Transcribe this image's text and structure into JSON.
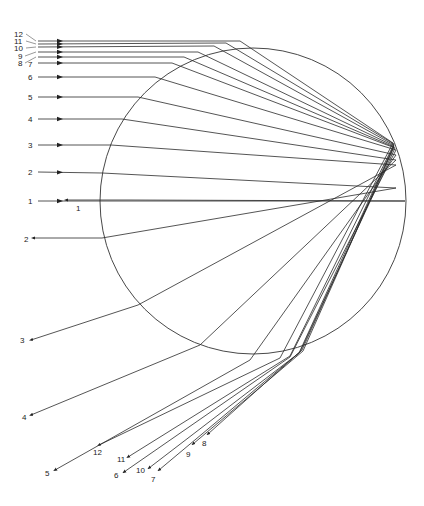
{
  "diagram": {
    "type": "ray-tracing",
    "colors": {
      "line": "#2a2a2a",
      "background": "#ffffff",
      "text": "#222222"
    },
    "drop": {
      "cx": 253,
      "cy": 201,
      "r": 153
    },
    "incoming_rays": [
      {
        "label": "1",
        "lx": 28,
        "ly": 201,
        "y": 201,
        "path": [
          [
            38,
            201
          ],
          [
            405,
            201
          ]
        ]
      },
      {
        "label": "2",
        "lx": 28,
        "ly": 172,
        "y": 172,
        "path": [
          [
            38,
            172
          ],
          [
            102,
            173
          ],
          [
            396,
            188
          ]
        ]
      },
      {
        "label": "3",
        "lx": 28,
        "ly": 145,
        "y": 145,
        "path": [
          [
            38,
            145
          ],
          [
            111,
            145
          ],
          [
            396,
            165
          ]
        ]
      },
      {
        "label": "4",
        "lx": 28,
        "ly": 119,
        "y": 119,
        "path": [
          [
            38,
            119
          ],
          [
            122,
            119
          ],
          [
            396,
            160
          ]
        ]
      },
      {
        "label": "5",
        "lx": 28,
        "ly": 97,
        "y": 97,
        "path": [
          [
            38,
            97
          ],
          [
            138,
            97
          ],
          [
            396,
            155
          ]
        ]
      },
      {
        "label": "6",
        "lx": 28,
        "ly": 77,
        "y": 77,
        "path": [
          [
            38,
            77
          ],
          [
            155,
            77
          ],
          [
            396,
            150
          ]
        ]
      },
      {
        "label": "7",
        "lx": 28,
        "ly": 64,
        "y": 64,
        "path": [
          [
            38,
            63
          ],
          [
            172,
            63
          ],
          [
            395,
            148
          ]
        ]
      },
      {
        "label": "8",
        "lx": 18,
        "ly": 63,
        "y": 57,
        "path": [
          [
            38,
            57
          ],
          [
            184,
            57
          ],
          [
            394,
            147
          ]
        ]
      },
      {
        "label": "9",
        "lx": 18,
        "ly": 56,
        "y": 52,
        "path": [
          [
            38,
            52
          ],
          [
            198,
            52
          ],
          [
            394,
            146
          ]
        ]
      },
      {
        "label": "10",
        "lx": 14,
        "ly": 48,
        "y": 47,
        "path": [
          [
            38,
            47
          ],
          [
            214,
            46
          ],
          [
            394,
            145
          ]
        ]
      },
      {
        "label": "11",
        "lx": 14,
        "ly": 41,
        "y": 44,
        "path": [
          [
            38,
            44
          ],
          [
            226,
            43
          ],
          [
            394,
            144
          ]
        ]
      },
      {
        "label": "12",
        "lx": 14,
        "ly": 34,
        "y": 41,
        "path": [
          [
            38,
            41
          ],
          [
            240,
            41
          ],
          [
            393,
            143
          ]
        ]
      }
    ],
    "internal_reflections": [
      {
        "label": "1",
        "path": [
          [
            405,
            201
          ],
          [
            130,
            200
          ]
        ]
      },
      {
        "label": "2",
        "path": [
          [
            396,
            188
          ],
          [
            102,
            238
          ]
        ]
      },
      {
        "label": "3",
        "path": [
          [
            396,
            165
          ],
          [
            138,
            305
          ]
        ]
      },
      {
        "label": "4",
        "path": [
          [
            396,
            160
          ],
          [
            200,
            345
          ]
        ]
      },
      {
        "label": "5",
        "path": [
          [
            396,
            155
          ],
          [
            250,
            360
          ]
        ]
      },
      {
        "label": "6",
        "path": [
          [
            396,
            150
          ],
          [
            290,
            357
          ]
        ]
      },
      {
        "label": "7",
        "path": [
          [
            395,
            148
          ],
          [
            300,
            352
          ]
        ]
      },
      {
        "label": "8",
        "path": [
          [
            394,
            147
          ],
          [
            302,
            350
          ]
        ]
      },
      {
        "label": "9",
        "path": [
          [
            394,
            146
          ],
          [
            303,
            351
          ]
        ]
      },
      {
        "label": "10",
        "path": [
          [
            394,
            145
          ],
          [
            299,
            353
          ]
        ]
      },
      {
        "label": "11",
        "path": [
          [
            394,
            144
          ],
          [
            290,
            356
          ]
        ]
      },
      {
        "label": "12",
        "path": [
          [
            393,
            143
          ],
          [
            280,
            358
          ]
        ]
      }
    ],
    "outgoing_rays": [
      {
        "label": "1",
        "lx": 76,
        "ly": 211,
        "path": [
          [
            130,
            200
          ],
          [
            66,
            200
          ]
        ]
      },
      {
        "label": "2",
        "lx": 24,
        "ly": 242,
        "path": [
          [
            102,
            238
          ],
          [
            33,
            238
          ]
        ]
      },
      {
        "label": "3",
        "lx": 20,
        "ly": 343,
        "path": [
          [
            138,
            305
          ],
          [
            31,
            340
          ]
        ]
      },
      {
        "label": "4",
        "lx": 22,
        "ly": 420,
        "path": [
          [
            200,
            345
          ],
          [
            31,
            415
          ]
        ]
      },
      {
        "label": "5",
        "lx": 45,
        "ly": 476,
        "path": [
          [
            250,
            360
          ],
          [
            55,
            470
          ]
        ]
      },
      {
        "label": "6",
        "lx": 114,
        "ly": 478,
        "path": [
          [
            290,
            357
          ],
          [
            124,
            472
          ]
        ]
      },
      {
        "label": "7",
        "lx": 151,
        "ly": 482,
        "path": [
          [
            300,
            352
          ],
          [
            159,
            470
          ]
        ]
      },
      {
        "label": "8",
        "lx": 202,
        "ly": 446,
        "path": [
          [
            302,
            350
          ],
          [
            208,
            434
          ]
        ]
      },
      {
        "label": "9",
        "lx": 186,
        "ly": 457,
        "path": [
          [
            303,
            351
          ],
          [
            193,
            444
          ]
        ]
      },
      {
        "label": "10",
        "lx": 136,
        "ly": 473,
        "path": [
          [
            299,
            353
          ],
          [
            149,
            468
          ]
        ]
      },
      {
        "label": "11",
        "lx": 117,
        "ly": 462,
        "path": [
          [
            290,
            356
          ],
          [
            128,
            457
          ]
        ]
      },
      {
        "label": "12",
        "lx": 93,
        "ly": 455,
        "path": [
          [
            280,
            358
          ],
          [
            99,
            445
          ]
        ]
      }
    ]
  }
}
